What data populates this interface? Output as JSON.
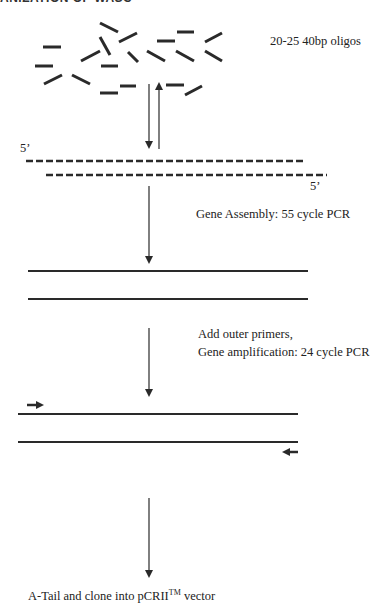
{
  "title_clipped": "ANIZATION OF WASC",
  "labels": {
    "oligos": "20-25 40bp oligos",
    "five_prime_top": "5’",
    "five_prime_bottom": "5’",
    "assembly": "Gene Assembly: 55 cycle PCR",
    "amplification_line1": "Add outer primers,",
    "amplification_line2": "Gene amplification: 24 cycle PCR",
    "clone_prefix": "A-Tail and clone into pCRII",
    "clone_sup": "TM",
    "clone_suffix": " vector"
  },
  "colors": {
    "ink": "#2a2a2a",
    "background": "#ffffff"
  },
  "steps": [
    {
      "name": "oligos",
      "text": "20-25 40bp oligos"
    },
    {
      "name": "assembly",
      "text": "Gene Assembly: 55 cycle PCR"
    },
    {
      "name": "amplification",
      "text": "Add outer primers, Gene amplification: 24 cycle PCR"
    },
    {
      "name": "cloning",
      "text": "A-Tail and clone into pCRII™ vector"
    }
  ]
}
